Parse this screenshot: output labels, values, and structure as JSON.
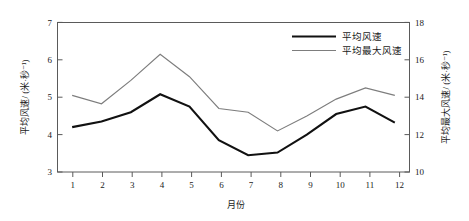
{
  "chart_data": {
    "type": "line",
    "title": "",
    "xlabel": "月份",
    "ylabel": "平均风速/ (米·秒⁻¹)",
    "y2label": "平均最大风速/ (米·秒⁻¹)",
    "categories": [
      "1",
      "2",
      "3",
      "4",
      "5",
      "6",
      "7",
      "8",
      "9",
      "10",
      "11",
      "12"
    ],
    "x": [
      1,
      2,
      3,
      4,
      5,
      6,
      7,
      8,
      9,
      10,
      11,
      12
    ],
    "xlim": [
      0.5,
      12.5
    ],
    "ylim": [
      3,
      7
    ],
    "y2lim": [
      10,
      18
    ],
    "yticks": [
      "3",
      "4",
      "5",
      "6",
      "7"
    ],
    "ytick_values": [
      3,
      4,
      5,
      6,
      7
    ],
    "y2ticks": [
      "10",
      "12",
      "14",
      "16",
      "18"
    ],
    "y2tick_values": [
      10,
      12,
      14,
      16,
      18
    ],
    "grid": false,
    "legend_position": "top-right",
    "series": [
      {
        "name": "平均风速",
        "axis": "left",
        "color": "#111111",
        "values": [
          4.2,
          4.35,
          4.6,
          5.08,
          4.75,
          3.85,
          3.45,
          3.52,
          4.0,
          4.55,
          4.75,
          4.32
        ]
      },
      {
        "name": "平均最大风速",
        "axis": "right",
        "color": "#7d7d7d",
        "values": [
          14.1,
          13.65,
          14.9,
          16.3,
          15.1,
          13.4,
          13.2,
          12.2,
          13.0,
          13.9,
          14.5,
          14.1
        ]
      }
    ]
  },
  "legend": {
    "items": [
      {
        "label": "平均风速"
      },
      {
        "label": "平均最大风速"
      }
    ]
  },
  "axes": {
    "left_title": "平均风速/ (米·秒⁻¹)",
    "right_title": "平均最大风速/ (米·秒⁻¹)",
    "bottom_title": "月份"
  }
}
